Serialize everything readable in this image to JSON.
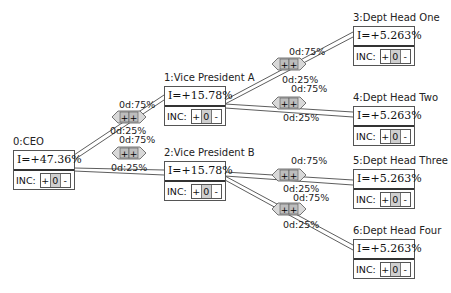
{
  "nodes": [
    {
      "id": 0,
      "title": "0:CEO",
      "value": "I=+47.36%",
      "inc_label": "INC:",
      "plus": "+",
      "count": "0",
      "minus": "-"
    },
    {
      "id": 1,
      "title": "1:Vice President A",
      "value": "I=+15.78%",
      "inc_label": "INC:",
      "plus": "+",
      "count": "0",
      "minus": "-"
    },
    {
      "id": 2,
      "title": "2:Vice President B",
      "value": "I=+15.78%",
      "inc_label": "INC:",
      "plus": "+",
      "count": "0",
      "minus": "-"
    },
    {
      "id": 3,
      "title": "3:Dept Head One",
      "value": "I=+5.263%",
      "inc_label": "INC:",
      "plus": "+",
      "count": "0",
      "minus": "-"
    },
    {
      "id": 4,
      "title": "4:Dept Head Two",
      "value": "I=+5.263%",
      "inc_label": "INC:",
      "plus": "+",
      "count": "0",
      "minus": "-"
    },
    {
      "id": 5,
      "title": "5:Dept Head Three",
      "value": "I=+5.263%",
      "inc_label": "INC:",
      "plus": "+",
      "count": "0",
      "minus": "-"
    },
    {
      "id": 6,
      "title": "6:Dept Head Four",
      "value": "I=+5.263%",
      "inc_label": "INC:",
      "plus": "+",
      "count": "0",
      "minus": "-"
    }
  ],
  "edges": [
    {
      "from": 0,
      "to": 1,
      "top_label": "0d:75%",
      "bottom_label": "0d:25%",
      "controls": "++"
    },
    {
      "from": 0,
      "to": 2,
      "top_label": "0d:75%",
      "bottom_label": "0d:25%",
      "controls": "++"
    },
    {
      "from": 1,
      "to": 3,
      "top_label": "0d:75%",
      "bottom_label": "0d:25%",
      "controls": "++"
    },
    {
      "from": 1,
      "to": 4,
      "top_label": "0d:75%",
      "bottom_label": "0d:25%",
      "controls": "++"
    },
    {
      "from": 2,
      "to": 5,
      "top_label": "0d:75%",
      "bottom_label": "0d:25%",
      "controls": "++"
    },
    {
      "from": 2,
      "to": 6,
      "top_label": "0d:75%",
      "bottom_label": "0d:25%",
      "controls": "++"
    }
  ]
}
